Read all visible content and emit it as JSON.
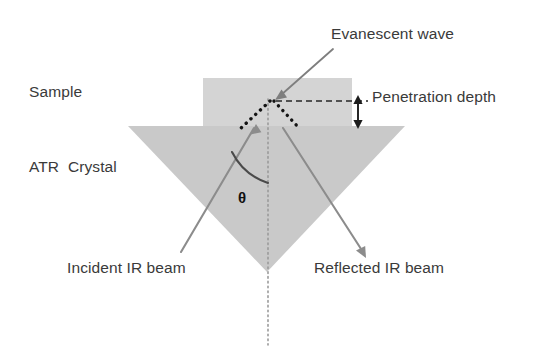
{
  "figure": {
    "colors": {
      "sample_fill": "#d4d4d4",
      "crystal_fill": "#c9c9c9",
      "beam_stroke": "#808080",
      "wave_stroke": "#1a1a1a",
      "text": "#3a3a3a",
      "background": "#ffffff"
    }
  },
  "labels": {
    "sample": "Sample",
    "atr_crystal": "ATR  Crystal",
    "evanescent_wave": "Evanescent wave",
    "penetration_depth": "Penetration depth",
    "incident_beam": "Incident IR beam",
    "reflected_beam": "Reflected IR beam",
    "angle_theta": "θ"
  },
  "geometry": {
    "sample_rect": {
      "x": 203,
      "y": 78,
      "width": 149,
      "height": 48
    },
    "crystal_triangle": {
      "left_x": 128,
      "right_x": 405,
      "top_y": 126,
      "apex_x": 267,
      "apex_y": 272
    },
    "reflection_point": {
      "x": 272,
      "y": 101
    },
    "normal_line": {
      "x": 268,
      "y_top": 101,
      "y_bottom": 345
    },
    "penetration_arrow": {
      "x": 358,
      "y_top": 97,
      "y_bottom": 126
    },
    "dashed_line": {
      "x_start": 274,
      "x_end": 366,
      "y": 101
    }
  }
}
